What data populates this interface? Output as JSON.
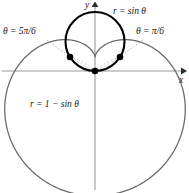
{
  "figure": {
    "type": "polar-curve-diagram",
    "background": "#ffffff",
    "width": 189,
    "height": 193
  },
  "axes": {
    "x_label": "x",
    "y_label": "y",
    "color": "#9a9a9a",
    "origin": {
      "x": 95,
      "y": 71
    },
    "x_axis": {
      "x1": 2,
      "y1": 71,
      "x2": 181,
      "y2": 71
    },
    "y_axis": {
      "x1": 95,
      "y1": 190,
      "x2": 95,
      "y2": 6
    }
  },
  "labels": {
    "circle_curve": "r = sin θ",
    "cardioid_curve": "r = 1 − sin θ",
    "theta_left": "θ = 5π/6",
    "theta_right": "θ = π/6"
  },
  "curves": [
    {
      "name": "circle",
      "equation": "r = sin θ",
      "color": "#000000",
      "stroke_width": 2.1,
      "center": {
        "x": 95,
        "y": 41.5
      },
      "radius": 29.5
    },
    {
      "name": "cardioid",
      "equation": "r = 1 - sin θ",
      "color": "#6b6b6b",
      "stroke_width": 1.3,
      "scale": 69.5,
      "center": {
        "x": 95,
        "y": 57
      }
    }
  ],
  "intersection_points": [
    {
      "name": "origin",
      "x": 95,
      "y": 71,
      "theta": "pole"
    },
    {
      "name": "left-intersection",
      "x": 70,
      "y": 57,
      "theta": "5π/6"
    },
    {
      "name": "right-intersection",
      "x": 120,
      "y": 57,
      "theta": "π/6"
    }
  ],
  "leader_lines": [
    {
      "name": "theta-left-leader",
      "x1": 47,
      "y1": 40,
      "x2": 68,
      "y2": 55
    },
    {
      "name": "theta-right-leader",
      "x1": 143,
      "y1": 40,
      "x2": 122,
      "y2": 55
    }
  ],
  "colors": {
    "axis": "#9a9a9a",
    "circle_stroke": "#000000",
    "cardioid_stroke": "#6b6b6b",
    "point_fill": "#000000",
    "leader": "#b0b0b0",
    "text": "#1a1a1a"
  }
}
